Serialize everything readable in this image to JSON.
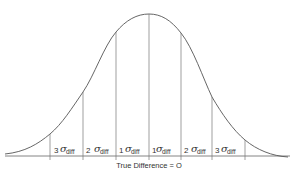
{
  "figure": {
    "type": "normal-distribution-diagram",
    "caption": "True Difference = O",
    "line_color": "#555555",
    "text_color": "#333333",
    "segments": [
      {
        "multiplier": "3",
        "symbol": "σ",
        "subscript": "diff"
      },
      {
        "multiplier": "2",
        "symbol": "σ",
        "subscript": "diff"
      },
      {
        "multiplier": "1",
        "symbol": "σ",
        "subscript": "diff"
      },
      {
        "multiplier": "1",
        "symbol": "σ",
        "subscript": "diff"
      },
      {
        "multiplier": "2",
        "symbol": "σ",
        "subscript": "diff"
      },
      {
        "multiplier": "3",
        "symbol": "σ",
        "subscript": "diff"
      }
    ]
  }
}
